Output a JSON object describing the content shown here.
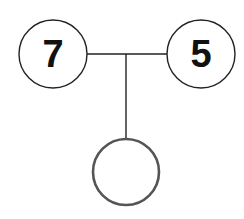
{
  "diagram": {
    "type": "number-bond",
    "nodes": [
      {
        "id": "left",
        "label": "7",
        "cx": 53,
        "cy": 54,
        "r": 34
      },
      {
        "id": "right",
        "label": "5",
        "cx": 201,
        "cy": 54,
        "r": 34
      },
      {
        "id": "bottom",
        "label": "",
        "cx": 126,
        "cy": 172,
        "r": 33
      }
    ],
    "colors": {
      "stroke_top": "#222222",
      "stroke_bottom": "#555555",
      "text": "#111111",
      "background": "#ffffff"
    }
  }
}
